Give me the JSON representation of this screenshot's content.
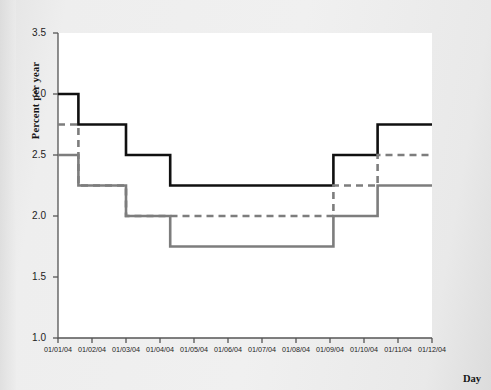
{
  "chart_data": {
    "type": "line",
    "title": "",
    "subtitle": "",
    "xlabel": "Day",
    "ylabel": "Percent per year",
    "grid": false,
    "legend": "none",
    "line_style": "step (piecewise constant)",
    "ylim": [
      1.0,
      3.5
    ],
    "ytick_labels": [
      "1.0",
      "1.5",
      "2.0",
      "2.5",
      "3.0",
      "3.5"
    ],
    "ytick_values": [
      1.0,
      1.5,
      2.0,
      2.5,
      3.0,
      3.5
    ],
    "xtick_labels": [
      "01/01/04",
      "01/02/04",
      "01/03/04",
      "01/04/04",
      "01/05/04",
      "01/06/04",
      "01/07/04",
      "01/08/04",
      "01/09/04",
      "01/10/04",
      "01/11/04",
      "01/12/04"
    ],
    "xtick_values": [
      1,
      2,
      3,
      4,
      5,
      6,
      7,
      8,
      9,
      10,
      11,
      12
    ],
    "xlim": [
      1,
      12
    ],
    "colors": {
      "black_series": "#101010",
      "gray_series": "#777777",
      "axis": "#555555",
      "plot_background": "#ffffff",
      "page_background": "#eaeaea"
    },
    "series": [
      {
        "name": "black-solid-step",
        "style": "solid",
        "color": "#101010",
        "width": 2.6,
        "steps": [
          {
            "x_start": 1.0,
            "x_end": 1.6,
            "y": 3.0
          },
          {
            "x_start": 1.6,
            "x_end": 3.0,
            "y": 2.75
          },
          {
            "x_start": 3.0,
            "x_end": 4.3,
            "y": 2.5
          },
          {
            "x_start": 4.3,
            "x_end": 9.1,
            "y": 2.25
          },
          {
            "x_start": 9.1,
            "x_end": 10.4,
            "y": 2.5
          },
          {
            "x_start": 10.4,
            "x_end": 12.0,
            "y": 2.75
          }
        ]
      },
      {
        "name": "gray-dashed-step",
        "style": "dashed",
        "color": "#7d7d7d",
        "width": 2.6,
        "steps": [
          {
            "x_start": 1.0,
            "x_end": 1.6,
            "y": 2.75
          },
          {
            "x_start": 1.6,
            "x_end": 3.0,
            "y": 2.25
          },
          {
            "x_start": 3.0,
            "x_end": 9.1,
            "y": 2.0
          },
          {
            "x_start": 9.1,
            "x_end": 10.4,
            "y": 2.25
          },
          {
            "x_start": 10.4,
            "x_end": 12.0,
            "y": 2.5
          }
        ]
      },
      {
        "name": "gray-solid-step",
        "style": "solid",
        "color": "#7d7d7d",
        "width": 2.6,
        "steps": [
          {
            "x_start": 1.0,
            "x_end": 1.6,
            "y": 2.5
          },
          {
            "x_start": 1.6,
            "x_end": 3.0,
            "y": 2.25
          },
          {
            "x_start": 3.0,
            "x_end": 4.3,
            "y": 2.0
          },
          {
            "x_start": 4.3,
            "x_end": 9.1,
            "y": 1.75
          },
          {
            "x_start": 9.1,
            "x_end": 10.4,
            "y": 2.0
          },
          {
            "x_start": 10.4,
            "x_end": 12.0,
            "y": 2.25
          }
        ]
      }
    ]
  },
  "axis": {
    "y_title": "Percent per year",
    "x_title": "Day"
  }
}
